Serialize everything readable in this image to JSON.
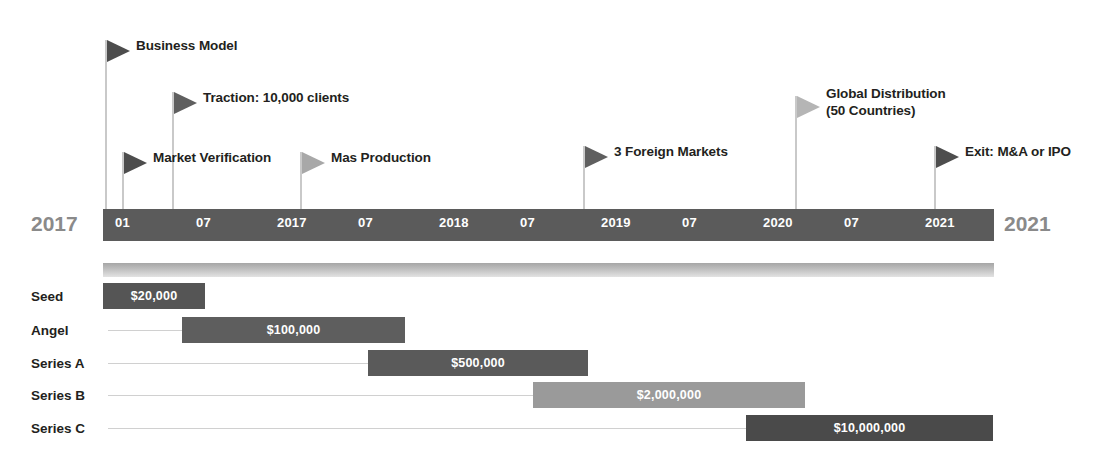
{
  "chart_data": {
    "type": "timeline",
    "axis": {
      "start_label": "2017",
      "end_label": "2021",
      "ticks": [
        "01",
        "07",
        "2017",
        "07",
        "2018",
        "07",
        "2019",
        "07",
        "2020",
        "07",
        "2021"
      ],
      "range": [
        "2017-01",
        "2021-01"
      ]
    },
    "milestones": [
      {
        "label": "Business Model",
        "x": 105,
        "pole_top": 40,
        "flag_color": "#4d4d4d"
      },
      {
        "label": "Traction: 10,000 clients",
        "x": 172,
        "pole_top": 92,
        "flag_color": "#5f5f5f"
      },
      {
        "label": "Market Verification",
        "x": 122,
        "pole_top": 152,
        "flag_color": "#4d4d4d"
      },
      {
        "label": "Mas Production",
        "x": 300,
        "pole_top": 152,
        "flag_color": "#a8a8a8"
      },
      {
        "label": "3 Foreign Markets",
        "x": 583,
        "pole_top": 146,
        "flag_color": "#5f5f5f"
      },
      {
        "label": "Global Distribution\n(50 Countries)",
        "x": 795,
        "pole_top": 96,
        "flag_color": "#b5b5b5"
      },
      {
        "label": "Exit: M&A or IPO",
        "x": 934,
        "pole_top": 146,
        "flag_color": "#4d4d4d"
      }
    ],
    "funding_rounds": [
      {
        "name": "Seed",
        "amount": "$20,000",
        "value": 20000,
        "bar_start": 103,
        "bar_end": 205,
        "color": "#555555"
      },
      {
        "name": "Angel",
        "amount": "$100,000",
        "value": 100000,
        "bar_start": 182,
        "bar_end": 405,
        "color": "#5e5e5e"
      },
      {
        "name": "Series A",
        "amount": "$500,000",
        "value": 500000,
        "bar_start": 368,
        "bar_end": 588,
        "color": "#5a5a5a"
      },
      {
        "name": "Series B",
        "amount": "$2,000,000",
        "value": 2000000,
        "bar_start": 533,
        "bar_end": 805,
        "color": "#9a9a9a"
      },
      {
        "name": "Series C",
        "amount": "$10,000,000",
        "value": 10000000,
        "bar_start": 746,
        "bar_end": 993,
        "color": "#4a4a4a"
      }
    ],
    "colors": {
      "axis_bar": "#5b5b5b",
      "axis_text": "#ffffff",
      "axis_end_text": "#8a8a8a",
      "label_text": "#231f20",
      "leader_line": "#d0d0d0"
    }
  }
}
